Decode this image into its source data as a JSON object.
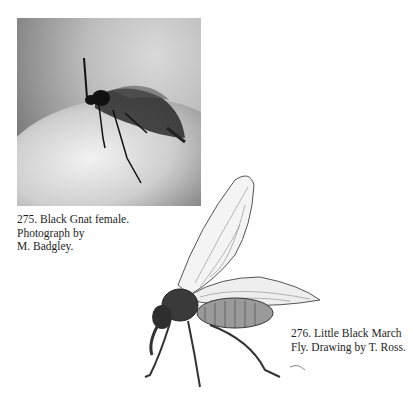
{
  "figures": [
    {
      "number": "275",
      "type": "photograph",
      "subject": "black-gnat-female",
      "caption": "275. Black Gnat female. Photograph by M. Badgley.",
      "caption_lines": [
        "275. Black Gnat female.",
        "Photograph by",
        "M. Badgley."
      ]
    },
    {
      "number": "276",
      "type": "drawing",
      "subject": "little-black-march-fly",
      "caption": "276. Little Black March Fly. Drawing by T. Ross.",
      "caption_lines": [
        "276. Little Black March",
        "Fly. Drawing by T. Ross."
      ]
    }
  ]
}
